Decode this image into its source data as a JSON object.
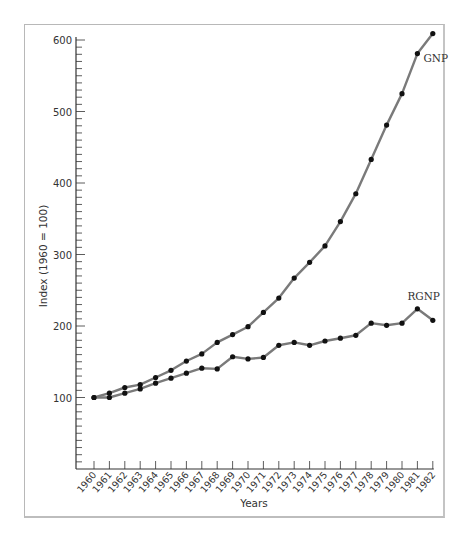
{
  "chart_data": {
    "type": "line",
    "title": "",
    "xlabel": "Years",
    "ylabel": "Index (1960 = 100)",
    "ylim": [
      0,
      600
    ],
    "yticks": [
      100,
      200,
      300,
      400,
      500,
      600
    ],
    "y_minor_step": 10,
    "grid": false,
    "legend": "inline labels at line ends",
    "categories": [
      "1960",
      "1961",
      "1962",
      "1963",
      "1964",
      "1965",
      "1966",
      "1967",
      "1968",
      "1969",
      "1970",
      "1971",
      "1972",
      "1973",
      "1974",
      "1975",
      "1976",
      "1977",
      "1978",
      "1979",
      "1980",
      "1981",
      "1982"
    ],
    "series": [
      {
        "name": "GNP",
        "values": [
          100,
          106,
          114,
          118,
          128,
          138,
          151,
          161,
          177,
          188,
          199,
          219,
          239,
          267,
          289,
          312,
          346,
          385,
          433,
          481,
          525,
          581,
          609
        ]
      },
      {
        "name": "RGNP",
        "values": [
          100,
          100,
          106,
          112,
          120,
          127,
          134,
          141,
          140,
          157,
          154,
          156,
          173,
          177,
          173,
          179,
          183,
          187,
          204,
          201,
          204,
          224,
          208
        ]
      }
    ],
    "colors": {
      "line": "#7a7a7a",
      "marker": "#111111",
      "axis": "#333333",
      "frame": "#b8b8b8"
    }
  }
}
